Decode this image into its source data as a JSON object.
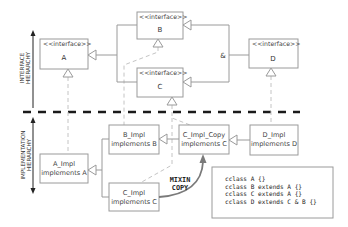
{
  "side_labels": {
    "interface": [
      "INTERFACE",
      "HIERARCHY"
    ],
    "implementation": [
      "IMPLEMENTATION",
      "HIERARCHY"
    ]
  },
  "interfaces": {
    "A": {
      "stereotype": "<<interface>>",
      "name": "A"
    },
    "B": {
      "stereotype": "<<interface>>",
      "name": "B"
    },
    "C": {
      "stereotype": "<<interface>>",
      "name": "C"
    },
    "D": {
      "stereotype": "<<interface>>",
      "name": "D"
    }
  },
  "composition_symbol": "&",
  "implementations": {
    "A_Impl": [
      "A_Impl",
      "implements A"
    ],
    "B_Impl": [
      "B_Impl",
      "implements B"
    ],
    "C_Impl_Copy": [
      "C_Impl_Copy",
      "implements C"
    ],
    "D_Impl": [
      "D_Impl",
      "implements D"
    ],
    "C_Impl": [
      "C_Impl",
      "implements C"
    ]
  },
  "mixin_label": [
    "MIXIN",
    "COPY"
  ],
  "code": {
    "lines": [
      "cclass A {}",
      "cclass B extends A {}",
      "cclass C extends A {}",
      "cclass D extends C & B {}"
    ]
  },
  "colors": {
    "separator": "#1a1a1a",
    "box_border": "#9a9a9a",
    "mixin_arrow": "#7a7a7a"
  }
}
